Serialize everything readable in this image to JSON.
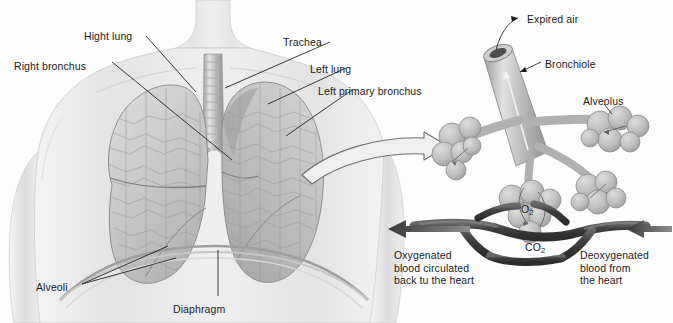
{
  "figure": {
    "background_color": "#fdfdfd",
    "ink_color": "#1b1b1b",
    "skin_tone": "#e9e9e9",
    "lung_tone": "#cfcfcf",
    "vessel_tone": "#4a4a4a",
    "width": 673,
    "height": 323
  },
  "left_panel": {
    "name": "thorax-overview",
    "labels": [
      {
        "id": "right-lung",
        "text": "Hight lung",
        "x": 84,
        "y": 30
      },
      {
        "id": "right-bronchus",
        "text": "Right bronchus",
        "x": 14,
        "y": 60
      },
      {
        "id": "trachea",
        "text": "Trachea",
        "x": 283,
        "y": 36
      },
      {
        "id": "left-lung",
        "text": "Left lung",
        "x": 310,
        "y": 63
      },
      {
        "id": "left-primary-bronchus",
        "text": "Left primary bronchus",
        "x": 318,
        "y": 85
      },
      {
        "id": "alveoli",
        "text": "Alveoli",
        "x": 36,
        "y": 281
      },
      {
        "id": "diaphragm",
        "text": "Diaphragm",
        "x": 173,
        "y": 303
      }
    ]
  },
  "right_panel": {
    "name": "alveolar-detail",
    "labels": [
      {
        "id": "expired-air",
        "text": "Expired air",
        "x": 527,
        "y": 13
      },
      {
        "id": "bronchiole",
        "text": "Bronchiole",
        "x": 545,
        "y": 58
      },
      {
        "id": "alveolus",
        "text": "Alveolus",
        "x": 583,
        "y": 95
      }
    ],
    "gas_labels": [
      {
        "id": "oxygen",
        "formula": "O",
        "subscript": "2",
        "x": 521,
        "y": 203
      },
      {
        "id": "carbon-dioxide",
        "formula": "CO",
        "subscript": "2",
        "x": 525,
        "y": 241
      }
    ],
    "flow_captions": [
      {
        "id": "oxygenated-blood",
        "text": "Oxygenated\nblood circulated\nback tu the heart",
        "x": 394,
        "y": 249
      },
      {
        "id": "deoxygenated-blood",
        "text": "Deoxygenated\nblood from\nthe heart",
        "x": 580,
        "y": 249
      }
    ]
  },
  "connectors": {
    "magnify_arrow": "curved-arrow-right",
    "blood_flow_left_arrow": "arrow-left",
    "blood_flow_right_arrow": "arrow-left"
  }
}
